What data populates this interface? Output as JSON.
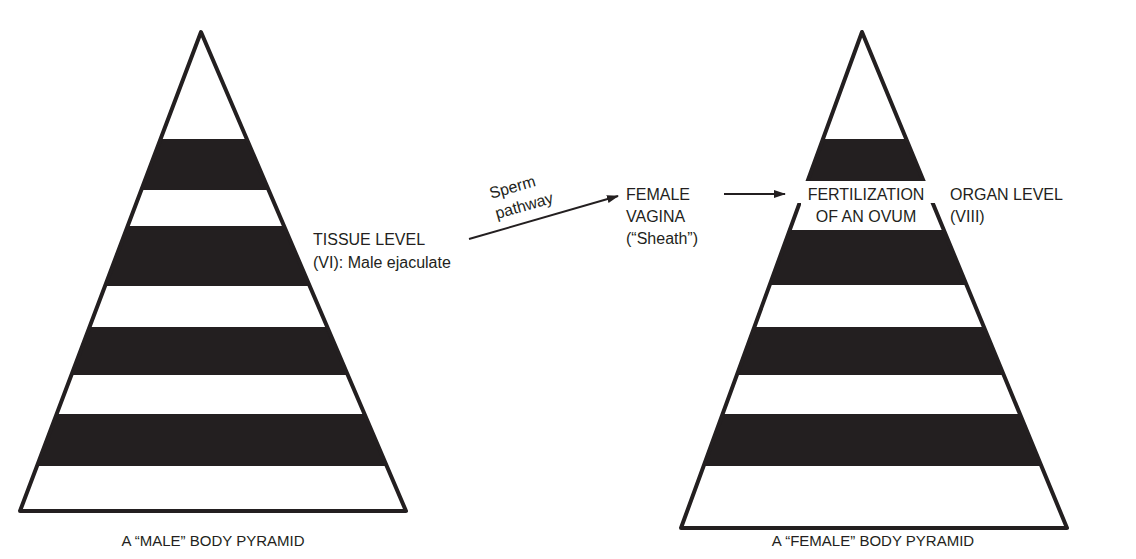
{
  "male_pyramid": {
    "caption": "A “MALE” BODY PYRAMID",
    "bands": [
      "white",
      "black",
      "white",
      "black",
      "white",
      "black",
      "white",
      "black",
      "white"
    ]
  },
  "female_pyramid": {
    "caption": "A “FEMALE” BODY PYRAMID",
    "bands": [
      "white",
      "black",
      "white",
      "black",
      "white",
      "black",
      "white",
      "black",
      "white"
    ],
    "band_label_line1": "FERTILIZATION",
    "band_label_line2": "OF AN OVUM"
  },
  "labels": {
    "tissue_level_line1": "TISSUE LEVEL",
    "tissue_level_line2": "(VI): Male ejaculate",
    "sperm_pathway_line1": "Sperm",
    "sperm_pathway_line2": "pathway",
    "female_vagina_line1": "FEMALE",
    "female_vagina_line2": "VAGINA",
    "female_vagina_line3": "(“Sheath”)",
    "organ_level_line1": "ORGAN LEVEL",
    "organ_level_line2": "(VIII)"
  },
  "colors": {
    "ink": "#231f20",
    "background": "#ffffff"
  }
}
